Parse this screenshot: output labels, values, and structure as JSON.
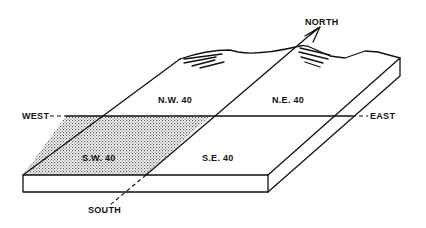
{
  "diagram": {
    "type": "block-diagram",
    "directions": {
      "north": "NORTH",
      "south": "SOUTH",
      "east": "EAST",
      "west": "WEST"
    },
    "quarters": [
      {
        "id": "nw",
        "label": "N.W. 40",
        "shaded": false
      },
      {
        "id": "ne",
        "label": "N.E. 40",
        "shaded": false
      },
      {
        "id": "sw",
        "label": "S.W. 40",
        "shaded": true
      },
      {
        "id": "se",
        "label": "S.E. 40",
        "shaded": false
      }
    ],
    "colors": {
      "ink": "#111111",
      "background": "#ffffff",
      "shade": "#9a9a9a"
    }
  }
}
